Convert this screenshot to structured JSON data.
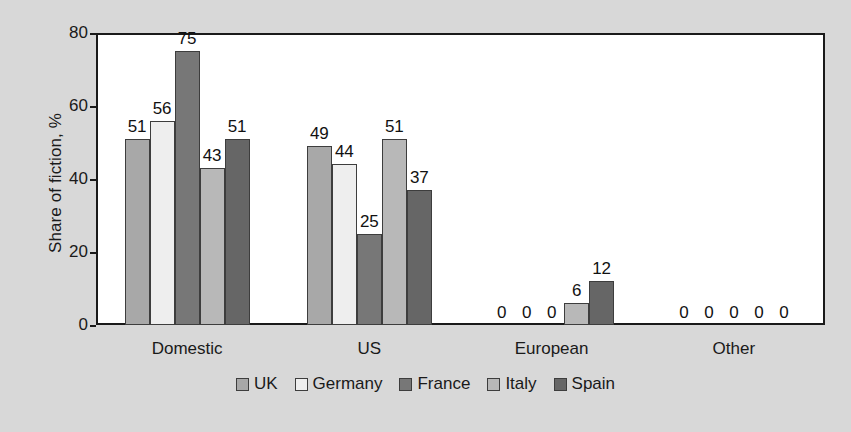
{
  "chart_data": {
    "type": "bar",
    "title": "",
    "subtitle": "",
    "xlabel": "",
    "ylabel": "Share of fiction, %",
    "ylim": [
      0,
      80
    ],
    "yticks": [
      0,
      20,
      40,
      60,
      80
    ],
    "ytick_labels": [
      "0",
      "20",
      "40",
      "60",
      "80"
    ],
    "grid": false,
    "legend_position": "bottom",
    "data_labels": true,
    "categories": [
      "Domestic",
      "US",
      "European",
      "Other"
    ],
    "series": [
      {
        "name": "UK",
        "color": "#a8a8a8",
        "values": [
          51,
          49,
          0,
          0
        ]
      },
      {
        "name": "Germany",
        "color": "#eeeeee",
        "values": [
          56,
          44,
          0,
          0
        ]
      },
      {
        "name": "France",
        "color": "#777777",
        "values": [
          75,
          25,
          0,
          0
        ]
      },
      {
        "name": "Italy",
        "color": "#b8b8b8",
        "values": [
          43,
          51,
          6,
          0
        ]
      },
      {
        "name": "Spain",
        "color": "#666666",
        "values": [
          51,
          37,
          12,
          0
        ]
      }
    ]
  },
  "figure": {
    "background_color": "#d8d8d8",
    "plot_background_color": "#ffffff",
    "axis_color": "#1a1a1a",
    "bar_border_color": "#3d3d3d"
  }
}
